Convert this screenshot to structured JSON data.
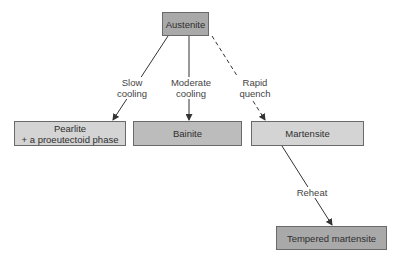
{
  "nodes": {
    "austenite": {
      "label": "Austenite"
    },
    "pearlite": {
      "line1": "Pearlite",
      "line2": "+ a proeutectoid phase"
    },
    "bainite": {
      "label": "Bainite"
    },
    "martensite": {
      "label": "Martensite"
    },
    "tempered": {
      "label": "Tempered martensite"
    }
  },
  "edges": {
    "slow": {
      "line1": "Slow",
      "line2": "cooling",
      "style": "solid"
    },
    "moderate": {
      "line1": "Moderate",
      "line2": "cooling",
      "style": "solid"
    },
    "rapid": {
      "line1": "Rapid",
      "line2": "quench",
      "style": "dashed"
    },
    "reheat": {
      "label": "Reheat",
      "style": "solid"
    }
  },
  "colors": {
    "dark_box": "#a9a9a9",
    "mid_box": "#bcbcbc",
    "light_box": "#d4d4d4",
    "line": "#333333"
  }
}
